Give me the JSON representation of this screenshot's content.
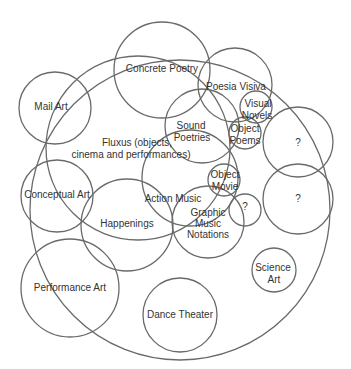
{
  "diagram": {
    "type": "venn-like circle diagram",
    "stroke_color": "#6a6a6a",
    "text_color": "#333333",
    "background": "#ffffff",
    "circles": [
      {
        "id": "outer-big",
        "label": "",
        "cx": 180,
        "cy": 210,
        "r": 150
      },
      {
        "id": "fluxus",
        "label_lines": [
          "Fluxus (objects,",
          "cinema and performances)"
        ],
        "cx": 138,
        "cy": 148,
        "r": 92
      },
      {
        "id": "mail-art",
        "label_lines": [
          "Mail Art"
        ],
        "cx": 55,
        "cy": 108,
        "r": 36
      },
      {
        "id": "concrete-poetry",
        "label_lines": [
          "Concrete Poetry"
        ],
        "cx": 162,
        "cy": 70,
        "r": 48
      },
      {
        "id": "poesia-visiva",
        "label_lines": [
          "Poesia Visiva"
        ],
        "cx": 235,
        "cy": 85,
        "r": 37
      },
      {
        "id": "visual-novels",
        "label_lines": [
          "Visual",
          "Novels"
        ],
        "cx": 256,
        "cy": 107,
        "r": 16
      },
      {
        "id": "sound-poetries",
        "label_lines": [
          "Sound",
          "Poetries"
        ],
        "cx": 202,
        "cy": 126,
        "r": 37
      },
      {
        "id": "object-poems",
        "label_lines": [
          "Object",
          "Poems"
        ],
        "cx": 245,
        "cy": 133,
        "r": 16
      },
      {
        "id": "question-1",
        "label_lines": [
          "?"
        ],
        "cx": 298,
        "cy": 142,
        "r": 35
      },
      {
        "id": "question-2",
        "label_lines": [
          "?"
        ],
        "cx": 298,
        "cy": 199,
        "r": 35
      },
      {
        "id": "object-movie",
        "label_lines": [
          "Object",
          "Movie"
        ],
        "cx": 224,
        "cy": 180,
        "r": 16
      },
      {
        "id": "question-3",
        "label_lines": [
          "?"
        ],
        "cx": 245,
        "cy": 210,
        "r": 16
      },
      {
        "id": "action-music",
        "label_lines": [
          "Action Music"
        ],
        "cx": 190,
        "cy": 178,
        "r": 48
      },
      {
        "id": "graphic-music-notations",
        "label_lines": [
          "Graphic",
          "Music",
          "Notations"
        ],
        "cx": 208,
        "cy": 222,
        "r": 36
      },
      {
        "id": "conceptual-art",
        "label_lines": [
          "Conceptual Art"
        ],
        "cx": 57,
        "cy": 196,
        "r": 36
      },
      {
        "id": "happenings",
        "label_lines": [
          "Happenings"
        ],
        "cx": 127,
        "cy": 225,
        "r": 46
      },
      {
        "id": "performance-art",
        "label_lines": [
          "Performance Art"
        ],
        "cx": 70,
        "cy": 288,
        "r": 49
      },
      {
        "id": "science-art",
        "label_lines": [
          "Science",
          "Art"
        ],
        "cx": 274,
        "cy": 270,
        "r": 22
      },
      {
        "id": "dance-theater",
        "label_lines": [
          "Dance Theater"
        ],
        "cx": 180,
        "cy": 315,
        "r": 37
      }
    ],
    "labels": [
      {
        "text": "Concrete Poetry",
        "x": 162,
        "y": 72
      },
      {
        "text": "Mail Art",
        "x": 51,
        "y": 110
      },
      {
        "text": "Poesia Visiva",
        "x": 236,
        "y": 90
      },
      {
        "text": "Visual",
        "x": 258,
        "y": 107
      },
      {
        "text": "Novels",
        "x": 257,
        "y": 119
      },
      {
        "text": "Sound",
        "x": 191,
        "y": 129
      },
      {
        "text": "Poetries",
        "x": 192,
        "y": 141
      },
      {
        "text": "Object",
        "x": 245,
        "y": 132
      },
      {
        "text": "Poems",
        "x": 245,
        "y": 144
      },
      {
        "text": "?",
        "x": 298,
        "y": 146
      },
      {
        "text": "Fluxus (objects,",
        "x": 137,
        "y": 146
      },
      {
        "text": "cinema and performances)",
        "x": 131,
        "y": 158
      },
      {
        "text": "Object",
        "x": 225,
        "y": 178
      },
      {
        "text": "Movie",
        "x": 225,
        "y": 190
      },
      {
        "text": "Conceptual Art",
        "x": 57,
        "y": 198
      },
      {
        "text": "Action Music",
        "x": 173,
        "y": 202
      },
      {
        "text": "?",
        "x": 245,
        "y": 210
      },
      {
        "text": "?",
        "x": 298,
        "y": 202
      },
      {
        "text": "Happenings",
        "x": 127,
        "y": 227
      },
      {
        "text": "Graphic",
        "x": 208,
        "y": 216
      },
      {
        "text": "Music",
        "x": 208,
        "y": 227
      },
      {
        "text": "Notations",
        "x": 208,
        "y": 238
      },
      {
        "text": "Science",
        "x": 273,
        "y": 271
      },
      {
        "text": "Art",
        "x": 274,
        "y": 283
      },
      {
        "text": "Performance Art",
        "x": 70,
        "y": 291
      },
      {
        "text": "Dance Theater",
        "x": 180,
        "y": 318
      }
    ]
  }
}
